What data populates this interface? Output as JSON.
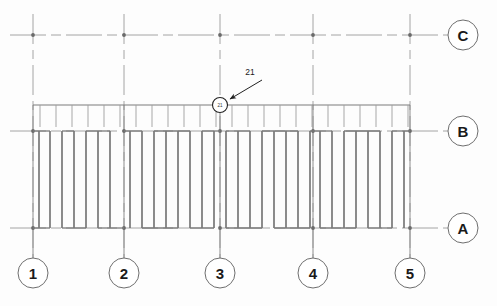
{
  "sheet": {
    "background_color": "#fdfdfd",
    "line_color": "#8a8a8a",
    "dark_line_color": "#5a5a5a",
    "bubble_stroke": "#6e6e6e",
    "text_color": "#1a1a1a"
  },
  "grid": {
    "horizontal_bubbles": [
      {
        "label": "C",
        "cx": 463,
        "cy": 35,
        "r": 15,
        "line_from_x": 10,
        "line_to_x": 448,
        "y": 35,
        "style": "dash-dot"
      },
      {
        "label": "B",
        "cx": 463,
        "cy": 131,
        "r": 15,
        "line_from_x": 10,
        "line_to_x": 448,
        "y": 131,
        "style": "dash-dot"
      },
      {
        "label": "A",
        "cx": 463,
        "cy": 228,
        "r": 15,
        "line_from_x": 10,
        "line_to_x": 448,
        "y": 228,
        "style": "dash-dot"
      }
    ],
    "vertical_bubbles": [
      {
        "label": "1",
        "cx": 33,
        "cy": 273,
        "r": 15,
        "line_from_y": 14,
        "line_to_y": 258,
        "x": 33
      },
      {
        "label": "2",
        "cx": 124,
        "cy": 273,
        "r": 15,
        "line_from_y": 14,
        "line_to_y": 258,
        "x": 124
      },
      {
        "label": "3",
        "cx": 220,
        "cy": 273,
        "r": 15,
        "line_from_y": 14,
        "line_to_y": 258,
        "x": 220
      },
      {
        "label": "4",
        "cx": 313,
        "cy": 273,
        "r": 15,
        "line_from_y": 14,
        "line_to_y": 258,
        "x": 313
      },
      {
        "label": "5",
        "cx": 410,
        "cy": 273,
        "r": 15,
        "line_from_y": 14,
        "line_to_y": 258,
        "x": 410
      }
    ],
    "intersection_nodes": [
      {
        "x": 33,
        "y": 35
      },
      {
        "x": 124,
        "y": 35
      },
      {
        "x": 220,
        "y": 35
      },
      {
        "x": 313,
        "y": 35
      },
      {
        "x": 410,
        "y": 35
      },
      {
        "x": 33,
        "y": 131
      },
      {
        "x": 124,
        "y": 131
      },
      {
        "x": 220,
        "y": 131
      },
      {
        "x": 313,
        "y": 131
      },
      {
        "x": 410,
        "y": 131
      },
      {
        "x": 33,
        "y": 228
      },
      {
        "x": 124,
        "y": 228
      },
      {
        "x": 220,
        "y": 228
      },
      {
        "x": 313,
        "y": 228
      },
      {
        "x": 410,
        "y": 228
      }
    ]
  },
  "edge_beam": {
    "y": 105,
    "x_start": 33,
    "x_end": 410,
    "tick_length": 22,
    "tick_positions": [
      40,
      56,
      72,
      88,
      104,
      120,
      136,
      152,
      168,
      184,
      200,
      216,
      232,
      248,
      264,
      280,
      296,
      312,
      328,
      344,
      360,
      376,
      392,
      408
    ]
  },
  "framing": {
    "top_y": 131,
    "bottom_y": 228,
    "joist_x": [
      39,
      50,
      62,
      74,
      86,
      98,
      110,
      130,
      142,
      154,
      166,
      178,
      190,
      202,
      214,
      226,
      238,
      250,
      262,
      274,
      286,
      298,
      310,
      320,
      332,
      344,
      356,
      368,
      380,
      392,
      404
    ],
    "bay_caps": [
      {
        "x1": 33,
        "x2": 50,
        "y": 131
      },
      {
        "x1": 62,
        "x2": 74,
        "y": 131
      },
      {
        "x1": 86,
        "x2": 110,
        "y": 131
      },
      {
        "x1": 124,
        "x2": 142,
        "y": 131
      },
      {
        "x1": 154,
        "x2": 190,
        "y": 131
      },
      {
        "x1": 202,
        "x2": 220,
        "y": 131
      },
      {
        "x1": 226,
        "x2": 250,
        "y": 131
      },
      {
        "x1": 262,
        "x2": 298,
        "y": 131
      },
      {
        "x1": 310,
        "x2": 332,
        "y": 131
      },
      {
        "x1": 344,
        "x2": 380,
        "y": 131
      },
      {
        "x1": 392,
        "x2": 410,
        "y": 131
      },
      {
        "x1": 33,
        "x2": 50,
        "y": 228
      },
      {
        "x1": 62,
        "x2": 86,
        "y": 228
      },
      {
        "x1": 98,
        "x2": 124,
        "y": 228
      },
      {
        "x1": 142,
        "x2": 178,
        "y": 228
      },
      {
        "x1": 190,
        "x2": 214,
        "y": 228
      },
      {
        "x1": 226,
        "x2": 262,
        "y": 228
      },
      {
        "x1": 274,
        "x2": 310,
        "y": 228
      },
      {
        "x1": 320,
        "x2": 356,
        "y": 228
      },
      {
        "x1": 368,
        "x2": 392,
        "y": 228
      }
    ]
  },
  "callout": {
    "id": "21",
    "bubble": {
      "cx": 220,
      "cy": 105,
      "r": 7.5
    },
    "label": "21",
    "label_x": 250,
    "label_y": 72,
    "leader": {
      "x1": 262,
      "y1": 80,
      "x2": 228,
      "y2": 99
    }
  }
}
